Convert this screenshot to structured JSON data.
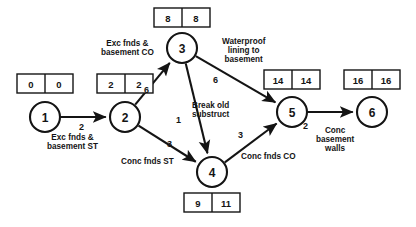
{
  "diagram": {
    "type": "activity-on-arrow network diagram",
    "nodes": [
      {
        "id": "1",
        "label": "1",
        "cx": 45,
        "cy": 117,
        "r": 15,
        "box": {
          "early": "0",
          "late": "0",
          "x": 17,
          "y": 74
        }
      },
      {
        "id": "2",
        "label": "2",
        "cx": 125,
        "cy": 117,
        "r": 15,
        "box": {
          "early": "2",
          "late": "2",
          "x": 97,
          "y": 74
        }
      },
      {
        "id": "3",
        "label": "3",
        "cx": 182,
        "cy": 48,
        "r": 15,
        "box": {
          "early": "8",
          "late": "8",
          "x": 154,
          "y": 8
        }
      },
      {
        "id": "4",
        "label": "4",
        "cx": 212,
        "cy": 172,
        "r": 15,
        "box": {
          "early": "9",
          "late": "11",
          "x": 184,
          "y": 193
        }
      },
      {
        "id": "5",
        "label": "5",
        "cx": 292,
        "cy": 112,
        "r": 15,
        "box": {
          "early": "14",
          "late": "14",
          "x": 264,
          "y": 70
        }
      },
      {
        "id": "6",
        "label": "6",
        "cx": 372,
        "cy": 112,
        "r": 15,
        "box": {
          "early": "16",
          "late": "16",
          "x": 344,
          "y": 70
        }
      }
    ],
    "edges": [
      {
        "id": "e1-2",
        "from": "1",
        "to": "2",
        "duration": "2",
        "activity": "Exc fnds &\nbasement ST",
        "duration_pos": {
          "x": 79,
          "y": 123
        },
        "activity_pos": {
          "x": 47,
          "y": 133
        }
      },
      {
        "id": "e2-3",
        "from": "2",
        "to": "3",
        "duration": "6",
        "activity": "Exc fnds &\nbasement CO",
        "duration_pos": {
          "x": 144,
          "y": 86
        },
        "activity_pos": {
          "x": 101,
          "y": 39
        }
      },
      {
        "id": "e2-4",
        "from": "2",
        "to": "4",
        "duration": "3",
        "activity": "Conc fnds ST",
        "duration_pos": {
          "x": 167,
          "y": 140
        },
        "activity_pos": {
          "x": 121,
          "y": 157
        }
      },
      {
        "id": "e3-5",
        "from": "3",
        "to": "5",
        "duration": "6",
        "activity": "Waterproof\nlining to\nbasement",
        "duration_pos": {
          "x": 213,
          "y": 76
        },
        "activity_pos": {
          "x": 222,
          "y": 37
        }
      },
      {
        "id": "e3-4",
        "from": "3",
        "to": "4",
        "duration": "1",
        "activity": "Break old\nsubstruct",
        "duration_pos": {
          "x": 176,
          "y": 116
        },
        "activity_pos": {
          "x": 192,
          "y": 101
        }
      },
      {
        "id": "e4-5",
        "from": "4",
        "to": "5",
        "duration": "3",
        "activity": "Conc fnds CO",
        "duration_pos": {
          "x": 238,
          "y": 131
        },
        "activity_pos": {
          "x": 241,
          "y": 152
        }
      },
      {
        "id": "e5-6",
        "from": "5",
        "to": "6",
        "duration": "2",
        "activity": "Conc\nbasement\nwalls",
        "duration_pos": {
          "x": 303,
          "y": 122
        },
        "activity_pos": {
          "x": 316,
          "y": 126
        }
      }
    ],
    "colors": {
      "stroke": "#141414",
      "fill": "#ffffff",
      "background": "#ffffff"
    }
  }
}
